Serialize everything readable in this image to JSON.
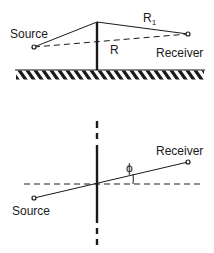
{
  "top_diagram": {
    "title": "barrier-side-view",
    "source_label": "Source",
    "receiver_label": "Receiver",
    "direct_path_label": "R",
    "diffracted_path_label": "R",
    "diffracted_path_subscript": "1"
  },
  "bottom_diagram": {
    "title": "barrier-plan-view",
    "source_label": "Source",
    "receiver_label": "Receiver",
    "angle_label": "ϕ"
  },
  "colors": {
    "line": "#1a1a1a",
    "background": "#ffffff"
  }
}
